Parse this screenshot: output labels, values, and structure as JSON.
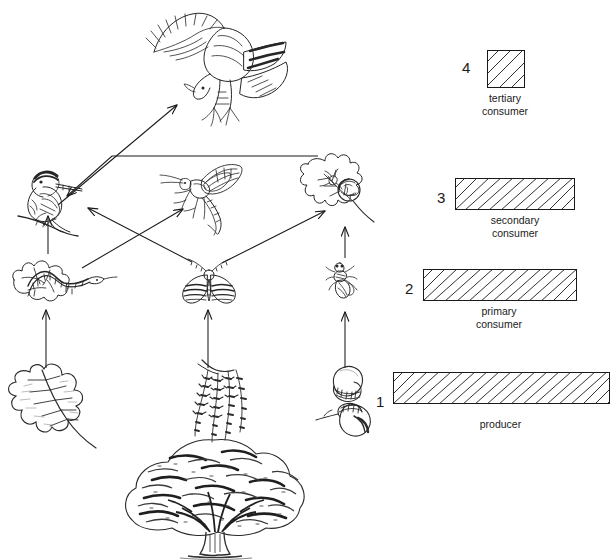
{
  "diagram": {
    "type": "food-web",
    "background": "#ffffff",
    "ink": "#1a1a1a"
  },
  "organisms": [
    {
      "id": "hawk",
      "name": "hawk",
      "icon": "hawk-icon",
      "trophic_level": 4,
      "trophic_label": "tertiary consumer",
      "x": 140,
      "y": 8,
      "w": 150,
      "h": 120
    },
    {
      "id": "songbird",
      "name": "songbird",
      "icon": "songbird-icon",
      "trophic_level": 3,
      "trophic_label": "secondary consumer",
      "x": 16,
      "y": 158,
      "w": 78,
      "h": 72
    },
    {
      "id": "wasp",
      "name": "ichneumon wasp",
      "icon": "ichneumon-wasp-icon",
      "trophic_level": 3,
      "trophic_label": "secondary consumer",
      "x": 160,
      "y": 158,
      "w": 82,
      "h": 76
    },
    {
      "id": "gallleaf",
      "name": "oak leaf with gall wasp",
      "icon": "oak-gall-leaf-icon",
      "trophic_level": 3,
      "trophic_label": "secondary consumer",
      "x": 296,
      "y": 150,
      "w": 84,
      "h": 76
    },
    {
      "id": "caterpillar",
      "name": "caterpillar on oak leaf",
      "icon": "caterpillar-icon",
      "trophic_level": 2,
      "trophic_label": "primary consumer",
      "x": 8,
      "y": 252,
      "w": 108,
      "h": 52
    },
    {
      "id": "moth",
      "name": "moth",
      "icon": "moth-icon",
      "trophic_level": 2,
      "trophic_label": "primary consumer",
      "x": 180,
      "y": 258,
      "w": 56,
      "h": 50
    },
    {
      "id": "weevil",
      "name": "weevil",
      "icon": "weevil-icon",
      "trophic_level": 2,
      "trophic_label": "primary consumer",
      "x": 326,
      "y": 258,
      "w": 34,
      "h": 42
    },
    {
      "id": "oakleaf",
      "name": "oak leaf",
      "icon": "oak-leaf-icon",
      "trophic_level": 1,
      "trophic_label": "producer",
      "x": 4,
      "y": 360,
      "w": 124,
      "h": 100
    },
    {
      "id": "catkins",
      "name": "oak catkins",
      "icon": "oak-catkins-icon",
      "trophic_level": 1,
      "trophic_label": "producer",
      "x": 168,
      "y": 358,
      "w": 92,
      "h": 110
    },
    {
      "id": "acorns",
      "name": "acorns",
      "icon": "acorns-icon",
      "trophic_level": 1,
      "trophic_label": "producer",
      "x": 316,
      "y": 362,
      "w": 66,
      "h": 78
    },
    {
      "id": "oaktree",
      "name": "oak tree",
      "icon": "oak-tree-icon",
      "trophic_level": 1,
      "trophic_label": "producer",
      "x": 118,
      "y": 436,
      "w": 192,
      "h": 122
    }
  ],
  "arrows": [
    {
      "id": "songbird-to-hawk",
      "from": "songbird",
      "to": "hawk",
      "label": "songbird eaten by hawk"
    },
    {
      "id": "gallleaf-to-songbird",
      "from": "gallleaf",
      "to": "songbird",
      "label": "gall wasp eaten by songbird"
    },
    {
      "id": "caterpillar-to-songbird",
      "from": "caterpillar",
      "to": "songbird",
      "label": "caterpillar eaten by songbird"
    },
    {
      "id": "caterpillar-to-wasp",
      "from": "caterpillar",
      "to": "wasp",
      "label": "caterpillar parasitised by ichneumon wasp"
    },
    {
      "id": "moth-to-songbird",
      "from": "moth",
      "to": "songbird",
      "label": "moth eaten by songbird"
    },
    {
      "id": "moth-to-gallleaf",
      "from": "moth",
      "to": "gallleaf",
      "label": "moth to gall wasp level"
    },
    {
      "id": "weevil-to-gallleaf",
      "from": "weevil",
      "to": "gallleaf",
      "label": "weevil eaten at gall leaf"
    },
    {
      "id": "oakleaf-to-caterpillar",
      "from": "oakleaf",
      "to": "caterpillar",
      "label": "oak leaf eaten by caterpillar"
    },
    {
      "id": "catkins-to-moth",
      "from": "catkins",
      "to": "moth",
      "label": "oak catkins eaten by moth"
    },
    {
      "id": "acorns-to-weevil",
      "from": "acorns",
      "to": "weevil",
      "label": "acorns eaten by weevil"
    }
  ],
  "legend": {
    "title": "trophic level key",
    "items": [
      {
        "number": "4",
        "caption_lines": [
          "tertiary",
          "consumer"
        ],
        "bar_width": 36,
        "bar_height": 36,
        "num_x": 462,
        "num_y": 60,
        "bar_x": 487,
        "bar_y": 50,
        "cap_x": 437,
        "cap_y": 92,
        "cap_w": 136
      },
      {
        "number": "3",
        "caption_lines": [
          "secondary",
          "consumer"
        ],
        "bar_width": 118,
        "bar_height": 30,
        "num_x": 437,
        "num_y": 190,
        "bar_x": 455,
        "bar_y": 178,
        "cap_x": 408,
        "cap_y": 214,
        "cap_w": 214
      },
      {
        "number": "2",
        "caption_lines": [
          "primary",
          "consumer"
        ],
        "bar_width": 152,
        "bar_height": 30,
        "num_x": 405,
        "num_y": 281,
        "bar_x": 423,
        "bar_y": 269,
        "cap_x": 392,
        "cap_y": 305,
        "cap_w": 214
      },
      {
        "number": "1",
        "caption_lines": [
          "producer"
        ],
        "bar_width": 215,
        "bar_height": 30,
        "num_x": 376,
        "num_y": 394,
        "bar_x": 393,
        "bar_y": 372,
        "cap_x": 393,
        "cap_y": 418,
        "cap_w": 215
      }
    ]
  }
}
